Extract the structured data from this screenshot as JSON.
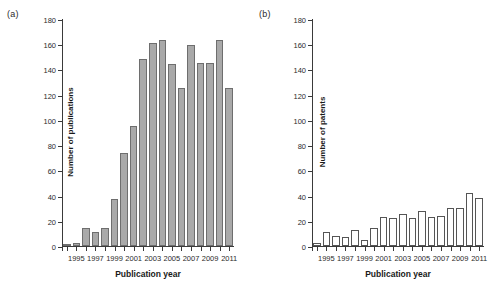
{
  "figure": {
    "background": "#ffffff",
    "width": 497,
    "height": 290
  },
  "panels": [
    {
      "tag": "(a)",
      "id": "publications"
    },
    {
      "tag": "(b)",
      "id": "patents"
    }
  ],
  "chart_data": [
    {
      "type": "bar",
      "panel": "(a)",
      "title": "",
      "xlabel": "Publication year",
      "ylabel": "Number of publications",
      "ylim": [
        0,
        180
      ],
      "yticks": [
        0,
        20,
        40,
        60,
        80,
        100,
        120,
        140,
        160,
        180
      ],
      "ytick_labels": [
        "0",
        "20",
        "40",
        "60",
        "80",
        "100",
        "120",
        "140",
        "160",
        "180"
      ],
      "xtick_labels": [
        "1995",
        "1997",
        "1999",
        "2001",
        "2003",
        "2005",
        "2007",
        "2009",
        "2011"
      ],
      "grid": false,
      "legend": null,
      "bar_style": "filled-gray",
      "bar_color": "#a9a9a9",
      "bar_edge_color": "#6e6e6e",
      "categories": [
        1994,
        1995,
        1996,
        1997,
        1998,
        1999,
        2000,
        2001,
        2002,
        2003,
        2004,
        2005,
        2006,
        2007,
        2008,
        2009,
        2010,
        2011
      ],
      "values": [
        1,
        2,
        14,
        11,
        14,
        37,
        74,
        95,
        148,
        161,
        163,
        144,
        125,
        159,
        145,
        145,
        163,
        125
      ]
    },
    {
      "type": "bar",
      "panel": "(b)",
      "title": "",
      "xlabel": "Publication year",
      "ylabel": "Number of patents",
      "ylim": [
        0,
        180
      ],
      "yticks": [
        0,
        20,
        40,
        60,
        80,
        100,
        120,
        140,
        160,
        180
      ],
      "ytick_labels": [
        "0",
        "20",
        "40",
        "60",
        "80",
        "100",
        "120",
        "140",
        "160",
        "180"
      ],
      "xtick_labels": [
        "1995",
        "1997",
        "1999",
        "2001",
        "2003",
        "2005",
        "2007",
        "2009",
        "2011"
      ],
      "grid": false,
      "legend": null,
      "bar_style": "hollow-outline",
      "bar_color": "#ffffff",
      "bar_edge_color": "#555555",
      "categories": [
        1994,
        1995,
        1996,
        1997,
        1998,
        1999,
        2000,
        2001,
        2002,
        2003,
        2004,
        2005,
        2006,
        2007,
        2008,
        2009,
        2010,
        2011
      ],
      "values": [
        2,
        11,
        8,
        7,
        13,
        5,
        14,
        23,
        22,
        25,
        22,
        28,
        23,
        24,
        30,
        30,
        42,
        38
      ]
    }
  ]
}
